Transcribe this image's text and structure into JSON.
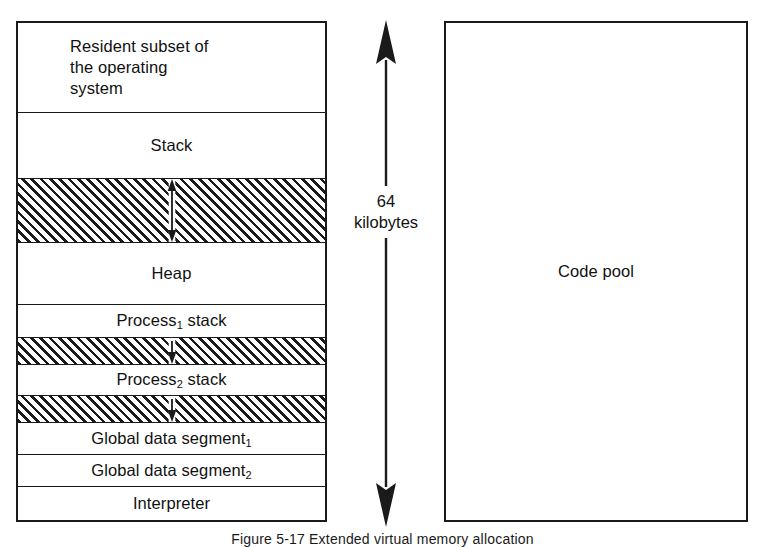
{
  "figure": {
    "caption": "Figure 5-17  Extended virtual memory allocation"
  },
  "memory_map": {
    "name": "64-kilobyte data space memory map",
    "bands": [
      {
        "id": "resident-os",
        "label": "Resident subset of\nthe operating\nsystem",
        "kind": "region",
        "align": "left",
        "top": 0,
        "height": 90,
        "rule": true
      },
      {
        "id": "stack",
        "label": "Stack",
        "kind": "region",
        "align": "center",
        "top": 90,
        "height": 65,
        "rule": false
      },
      {
        "id": "free-space-stack-heap",
        "label": "",
        "kind": "free-space",
        "arrow": "double",
        "top": 155,
        "height": 65,
        "rule": false
      },
      {
        "id": "heap",
        "label": "Heap",
        "kind": "region",
        "align": "center",
        "top": 220,
        "height": 62,
        "rule": true
      },
      {
        "id": "process-1-stack",
        "label": "Process<sub>1</sub> stack",
        "kind": "region",
        "align": "center",
        "top": 282,
        "height": 32,
        "rule": false
      },
      {
        "id": "free-space-process-1",
        "label": "",
        "kind": "free-space",
        "arrow": "down",
        "top": 314,
        "height": 28,
        "rule": false
      },
      {
        "id": "process-2-stack",
        "label": "Process<sub>2</sub> stack",
        "kind": "region",
        "align": "center",
        "top": 342,
        "height": 30,
        "rule": false
      },
      {
        "id": "free-space-process-2",
        "label": "",
        "kind": "free-space",
        "arrow": "down",
        "top": 372,
        "height": 28,
        "rule": false
      },
      {
        "id": "global-data-segment-1",
        "label": "Global data segment<sub>1</sub>",
        "kind": "region",
        "align": "center",
        "top": 400,
        "height": 32,
        "rule": true
      },
      {
        "id": "global-data-segment-2",
        "label": "Global data segment<sub>2</sub>",
        "kind": "region",
        "align": "center",
        "top": 432,
        "height": 32,
        "rule": true
      },
      {
        "id": "interpreter",
        "label": "Interpreter",
        "kind": "region",
        "align": "center",
        "top": 464,
        "height": 33,
        "rule": false
      }
    ]
  },
  "extent": {
    "label": "64\nkilobytes",
    "arrow_style": "double-headed-vertical"
  },
  "code_pool": {
    "label": "Code pool"
  },
  "colors": {
    "ink": "#1a1a1a",
    "paper": "#ffffff"
  }
}
